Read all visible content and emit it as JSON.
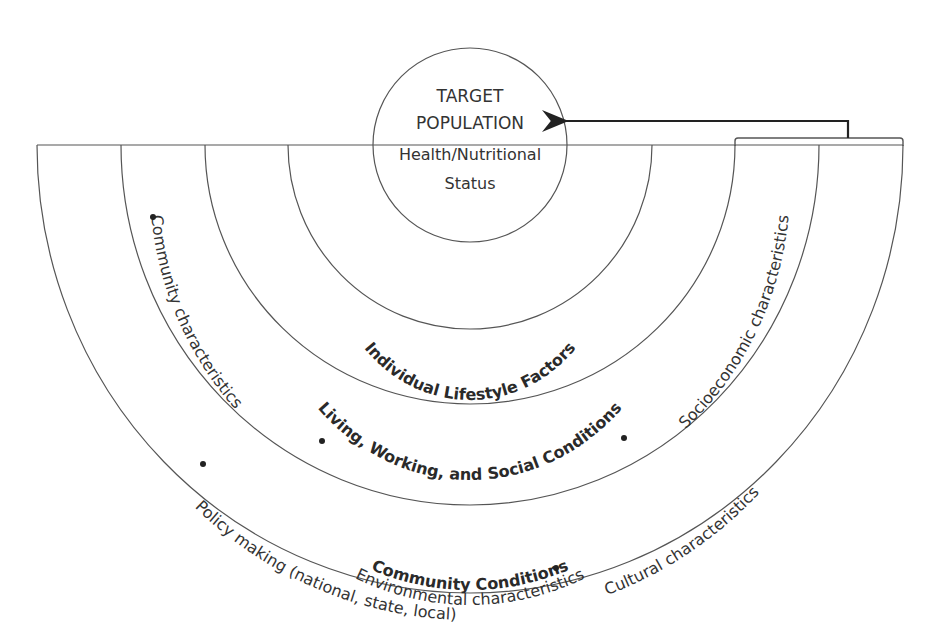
{
  "diagram": {
    "center": {
      "line1": "TARGET",
      "line2": "POPULATION",
      "line3": "Health/Nutritional",
      "line4": "Status"
    },
    "layers": [
      {
        "name": "Individual Lifestyle Factors"
      },
      {
        "name": "Living, Working, and Social Conditions"
      },
      {
        "name": "Community Conditions",
        "items": [
          "Community characteristics",
          "Environmental characteristics",
          "Socioeconomic characteristics"
        ]
      },
      {
        "name": "Background Conditions",
        "items": [
          "Policy making (national, state, local)",
          "Cultural characteristics"
        ]
      }
    ],
    "colors": {
      "line": "#555555",
      "text": "#333333",
      "arrow": "#222222",
      "background": "#ffffff"
    }
  }
}
